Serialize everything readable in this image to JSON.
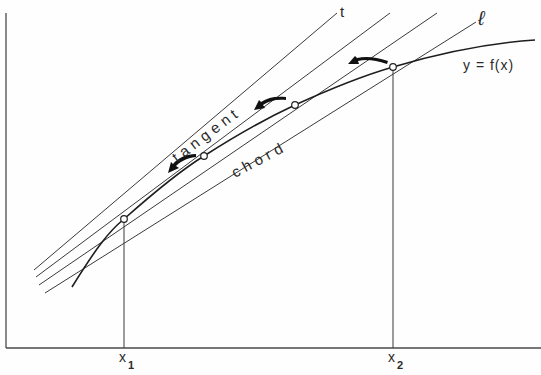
{
  "diagram": {
    "labels": {
      "tangent_line": "t",
      "chord_line": "ℓ",
      "function": "y = f(x)",
      "tangent_word": "tangent",
      "chord_word": "chord",
      "x1": "x",
      "x1_sub": "1",
      "x2": "x",
      "x2_sub": "2"
    },
    "points": [
      {
        "name": "x1-point",
        "x": 124,
        "y": 219
      },
      {
        "name": "intermediate-point-1",
        "x": 204,
        "y": 156
      },
      {
        "name": "intermediate-point-2",
        "x": 295,
        "y": 105
      },
      {
        "name": "x2-point",
        "x": 393,
        "y": 67
      }
    ]
  }
}
